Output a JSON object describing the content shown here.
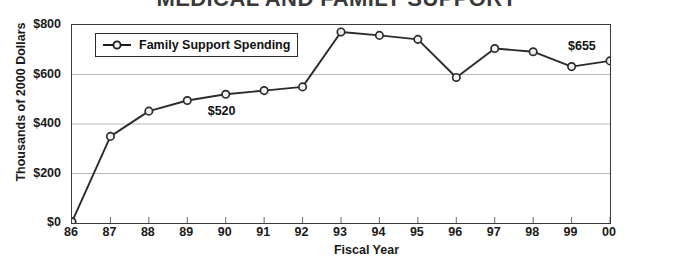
{
  "chart_data": {
    "type": "line",
    "title": "MEDICAL AND FAMILY SUPPORT",
    "xlabel": "Fiscal Year",
    "ylabel": "Thousands of 2000 Dollars",
    "categories": [
      "86",
      "87",
      "88",
      "89",
      "90",
      "91",
      "92",
      "93",
      "94",
      "95",
      "96",
      "97",
      "98",
      "99",
      "00"
    ],
    "series": [
      {
        "name": "Family Support Spending",
        "values": [
          5,
          350,
          452,
          495,
          520,
          535,
          550,
          772,
          758,
          742,
          588,
          705,
          692,
          632,
          655
        ]
      }
    ],
    "ylim": [
      0,
      800
    ],
    "yticks": [
      0,
      200,
      400,
      600,
      800
    ],
    "ytick_labels": [
      "$0",
      "$200",
      "$400",
      "$600",
      "$800"
    ],
    "grid": true,
    "grid_axis": "y",
    "legend_position": "upper left inside",
    "annotations": [
      {
        "text": "$520",
        "category": "90",
        "value": 520,
        "placement": "below"
      },
      {
        "text": "$655",
        "category": "00",
        "value": 655,
        "placement": "above-left"
      }
    ],
    "marker": "open-circle",
    "line_color": "#2b2b2b",
    "marker_fill": "#f2f2f2",
    "grid_color": "#b9b9b9",
    "frame_color": "#3a3a3a"
  },
  "legend": {
    "entries": [
      {
        "label": "Family Support Spending"
      }
    ]
  }
}
